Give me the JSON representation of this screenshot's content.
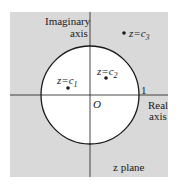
{
  "diagram": {
    "type": "complex-plane",
    "region_fill": "#d9d9d9",
    "disk_fill": "#ffffff",
    "stroke": "#1a1a1a",
    "labels": {
      "imag_axis_line1": "Imaginary",
      "imag_axis_line2": "axis",
      "real_axis_line1": "Real",
      "real_axis_line2": "axis",
      "origin": "O",
      "unit": "1",
      "plane": "z plane",
      "c1": "z=c",
      "c1_sub": "1",
      "c2": "z=c",
      "c2_sub": "2",
      "c3": "z=c",
      "c3_sub": "3"
    },
    "points": [
      {
        "name": "c1",
        "x": -0.45,
        "y": 0.2
      },
      {
        "name": "c2",
        "x": 0.3,
        "y": 0.35
      },
      {
        "name": "c3",
        "x": 0.65,
        "y": 1.2
      }
    ],
    "unit_circle_radius": 1
  }
}
